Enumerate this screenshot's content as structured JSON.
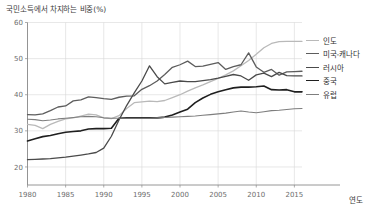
{
  "chart_data": {
    "type": "line",
    "title": "국민소득에서 차지하는 비중(%)",
    "xlabel": "연도",
    "ylabel": "",
    "xlim": [
      1980,
      2016
    ],
    "ylim": [
      15,
      60
    ],
    "yticks": [
      20,
      30,
      40,
      50,
      60
    ],
    "xticks": [
      1980,
      1985,
      1990,
      1995,
      2000,
      2005,
      2010,
      2015
    ],
    "grid": true,
    "legend_position": "right",
    "x": [
      1980,
      1981,
      1982,
      1983,
      1984,
      1985,
      1986,
      1987,
      1988,
      1989,
      1990,
      1991,
      1992,
      1993,
      1994,
      1995,
      1996,
      1997,
      1998,
      1999,
      2000,
      2001,
      2002,
      2003,
      2004,
      2005,
      2006,
      2007,
      2008,
      2009,
      2010,
      2011,
      2012,
      2013,
      2014,
      2015,
      2016
    ],
    "series": [
      {
        "name": "인도",
        "color": "#b9b9b9",
        "width": 1.3,
        "values": [
          31.8,
          31.5,
          30.6,
          31.8,
          32.6,
          33.3,
          33.6,
          34.1,
          34.6,
          34.4,
          33.6,
          33.4,
          34.2,
          36.2,
          37.8,
          38.0,
          38.2,
          38.1,
          38.4,
          39.2,
          40.0,
          41.0,
          41.9,
          42.7,
          43.6,
          44.5,
          45.5,
          46.6,
          48.0,
          49.5,
          51.2,
          53.0,
          54.2,
          54.7,
          54.8,
          54.8,
          54.8
        ]
      },
      {
        "name": "미국-캐나다",
        "color": "#5d5d5d",
        "width": 1.3,
        "values": [
          34.5,
          34.4,
          34.7,
          35.6,
          36.6,
          36.9,
          38.3,
          38.6,
          39.4,
          39.2,
          38.9,
          38.7,
          39.3,
          39.6,
          39.7,
          41.5,
          42.5,
          43.8,
          45.6,
          47.6,
          48.3,
          49.3,
          47.8,
          47.9,
          48.4,
          48.9,
          47.0,
          47.8,
          48.3,
          51.6,
          47.7,
          46.2,
          47.0,
          45.4,
          46.3,
          46.4,
          46.5
        ]
      },
      {
        "name": "러시아",
        "color": "#4a4a4a",
        "width": 1.3,
        "values": [
          22.0,
          22.1,
          22.2,
          22.3,
          22.5,
          22.7,
          23.0,
          23.3,
          23.6,
          24.0,
          25.2,
          28.5,
          33.0,
          37.0,
          40.5,
          43.8,
          48.0,
          45.0,
          43.0,
          43.4,
          43.8,
          43.6,
          43.6,
          43.9,
          44.2,
          44.6,
          45.1,
          45.6,
          45.2,
          44.0,
          45.5,
          46.0,
          45.0,
          46.2,
          45.3,
          45.2,
          45.2
        ]
      },
      {
        "name": "중국",
        "color": "#1f1f1f",
        "width": 1.6,
        "values": [
          27.2,
          27.8,
          28.4,
          28.7,
          29.2,
          29.6,
          29.8,
          30.0,
          30.5,
          30.6,
          30.6,
          30.7,
          33.5,
          33.6,
          33.6,
          33.6,
          33.6,
          33.6,
          33.8,
          34.4,
          35.2,
          36.0,
          37.8,
          39.1,
          40.1,
          40.8,
          41.4,
          41.9,
          42.1,
          42.1,
          42.2,
          42.4,
          41.4,
          41.3,
          41.4,
          40.8,
          40.8
        ]
      },
      {
        "name": "유럽",
        "color": "#7e7e7e",
        "width": 1.1,
        "values": [
          33.2,
          33.1,
          32.8,
          33.0,
          33.3,
          33.5,
          33.7,
          33.9,
          34.0,
          33.9,
          33.6,
          33.5,
          33.5,
          33.5,
          33.5,
          33.5,
          33.5,
          33.6,
          33.7,
          33.8,
          33.9,
          34.0,
          34.1,
          34.3,
          34.5,
          34.7,
          34.9,
          35.2,
          35.5,
          35.2,
          35.0,
          35.3,
          35.6,
          35.7,
          35.9,
          36.1,
          36.2
        ]
      }
    ]
  },
  "legend": {
    "items": [
      {
        "label": "인도"
      },
      {
        "label": "미국-캐나다"
      },
      {
        "label": "러시아"
      },
      {
        "label": "중국"
      },
      {
        "label": "유럽"
      }
    ]
  }
}
